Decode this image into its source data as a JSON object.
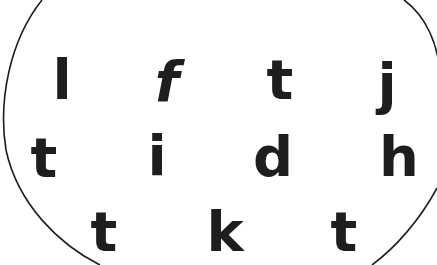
{
  "worksheet": {
    "shape": "oval",
    "stroke_color": "#1e1e1e",
    "letter_color": "#1e1e1e",
    "rows": [
      {
        "letters": [
          {
            "char": "l",
            "x": 62,
            "y": 80
          },
          {
            "char": "f",
            "x": 167,
            "y": 82
          },
          {
            "char": "t",
            "x": 280,
            "y": 80
          },
          {
            "char": "j",
            "x": 387,
            "y": 84
          }
        ]
      },
      {
        "letters": [
          {
            "char": "t",
            "x": 44,
            "y": 158
          },
          {
            "char": "i",
            "x": 157,
            "y": 156
          },
          {
            "char": "d",
            "x": 273,
            "y": 157
          },
          {
            "char": "h",
            "x": 399,
            "y": 157
          }
        ]
      },
      {
        "letters": [
          {
            "char": "t",
            "x": 104,
            "y": 232
          },
          {
            "char": "k",
            "x": 225,
            "y": 232
          },
          {
            "char": "t",
            "x": 344,
            "y": 232
          }
        ]
      }
    ]
  }
}
